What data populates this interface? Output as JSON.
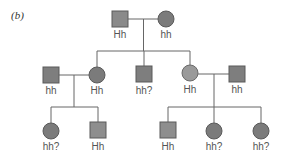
{
  "panel": {
    "label_open": "(",
    "label_letter": "b",
    "label_close": ")"
  },
  "colors": {
    "fill_dark": "#7b7b7b",
    "fill_light": "#9a9a9a",
    "fill_square": "#888888",
    "stroke": "#5a5a5a",
    "line": "#666666"
  },
  "generations": [
    {
      "index": 1,
      "individuals": [
        {
          "id": "g1-father",
          "sex": "male",
          "genotype": "Hh"
        },
        {
          "id": "g1-mother",
          "sex": "female",
          "genotype": "hh"
        }
      ]
    },
    {
      "index": 2,
      "individuals": [
        {
          "id": "g2-spouse-left",
          "sex": "male",
          "genotype": "hh"
        },
        {
          "id": "g2-daughter-1",
          "sex": "female",
          "genotype": "Hh"
        },
        {
          "id": "g2-son",
          "sex": "male",
          "genotype": "hh?"
        },
        {
          "id": "g2-daughter-2",
          "sex": "female",
          "genotype": "Hh"
        },
        {
          "id": "g2-spouse-right",
          "sex": "male",
          "genotype": "hh"
        }
      ]
    },
    {
      "index": 3,
      "individuals": [
        {
          "id": "g3-left-daughter",
          "sex": "female",
          "genotype": "hh?"
        },
        {
          "id": "g3-left-son",
          "sex": "male",
          "genotype": "Hh"
        },
        {
          "id": "g3-right-son",
          "sex": "male",
          "genotype": "Hh"
        },
        {
          "id": "g3-right-daughter-1",
          "sex": "female",
          "genotype": "hh?"
        },
        {
          "id": "g3-right-daughter-2",
          "sex": "female",
          "genotype": "hh?"
        }
      ]
    }
  ]
}
